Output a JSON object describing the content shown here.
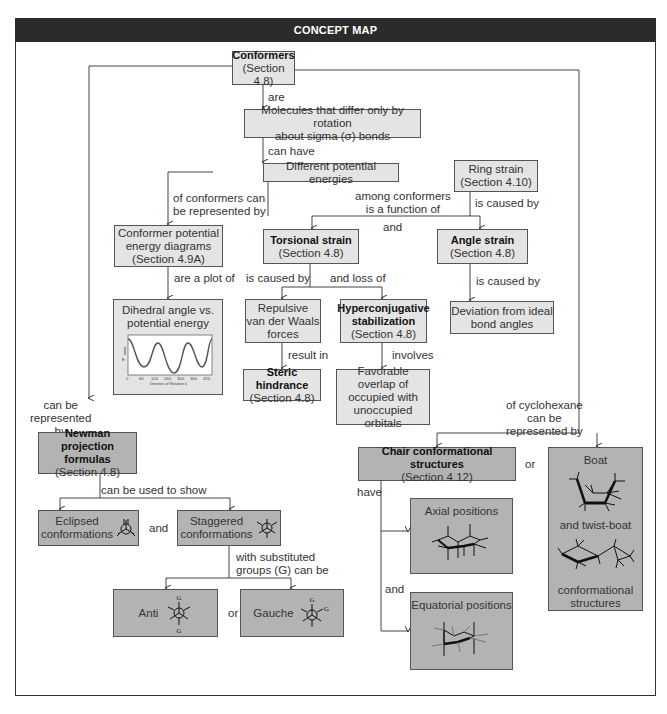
{
  "header": {
    "title": "CONCEPT MAP"
  },
  "nodes": {
    "conformers": {
      "title": "Conformers",
      "section": "(Section 4.8)"
    },
    "molecules": {
      "line1": "Molecules that differ only by rotation",
      "line2": "about sigma (σ) bonds"
    },
    "energies": {
      "text": "Different potential energies"
    },
    "ring_strain": {
      "title": "Ring strain",
      "section": "(Section 4.10)"
    },
    "pe_diagrams": {
      "line1": "Conformer potential",
      "line2": "energy diagrams",
      "section": "(Section 4.9A)"
    },
    "torsional": {
      "title": "Torsional strain",
      "section": "(Section 4.8)"
    },
    "angle_strain": {
      "title": "Angle strain",
      "section": "(Section 4.8)"
    },
    "dihedral": {
      "line1": "Dihedral angle vs.",
      "line2": "potential energy"
    },
    "repulsive": {
      "line1": "Repulsive",
      "line2": "van der Waals",
      "line3": "forces"
    },
    "hyperconj": {
      "title1": "Hyperconjugative",
      "title2": "stabilization",
      "section": "(Section 4.8)"
    },
    "deviation": {
      "line1": "Deviation from ideal",
      "line2": "bond angles"
    },
    "steric": {
      "title": "Steric hindrance",
      "section": "(Section 4.8)"
    },
    "favorable": {
      "line1": "Favorable overlap of",
      "line2": "occupied with",
      "line3": "unoccupied",
      "line4": "orbitals"
    },
    "newman": {
      "title1": "Newman projection",
      "title2": "formulas",
      "section": "(Section 4.8)"
    },
    "chair": {
      "title": "Chair conformational structures",
      "section": "(Section 4.12)"
    },
    "boat": {
      "line1": "Boat",
      "line2": "and twist-boat",
      "line3": "conformational",
      "line4": "structures"
    },
    "eclipsed": {
      "line1": "Eclipsed",
      "line2": "conformations"
    },
    "staggered": {
      "line1": "Staggered",
      "line2": "conformations"
    },
    "axial": {
      "text": "Axial positions"
    },
    "equatorial": {
      "text": "Equatorial positions"
    },
    "anti": {
      "text": "Anti",
      "sub": "G"
    },
    "gauche": {
      "text": "Gauche",
      "sub": "G"
    }
  },
  "links": {
    "are": "are",
    "can_have": "can have",
    "of_conformers_1": "of conformers can",
    "of_conformers_2": "be represented by",
    "among_1": "among conformers",
    "among_2": "is a function of",
    "and_1": "and",
    "is_caused_by_ring": "is caused by",
    "are_plot_of": "are a plot of",
    "is_caused_by_tors": "is caused by",
    "and_loss_of": "and loss of",
    "is_caused_by_angle": "is caused by",
    "result_in": "result in",
    "involves": "involves",
    "can_be_1": "can be",
    "can_be_2": "represented",
    "can_be_3": "by",
    "cyclo_1": "of cyclohexane",
    "cyclo_2": "can be",
    "cyclo_3": "represented by",
    "can_be_used": "can be used to show",
    "and_2": "and",
    "or_1": "or",
    "have": "have",
    "and_3": "and",
    "subst_1": "with substituted",
    "subst_2": "groups (G) can be",
    "or_2": "or"
  },
  "plot": {
    "x_ticks": [
      "0",
      "60",
      "120",
      "240",
      "300",
      "360",
      "420"
    ],
    "x_label": "Degrees of Rotation θ",
    "y_label": "E"
  },
  "colors": {
    "light_box": "#e4e4e4",
    "dark_box": "#b3b3b3",
    "header": "#2b2b2b"
  }
}
